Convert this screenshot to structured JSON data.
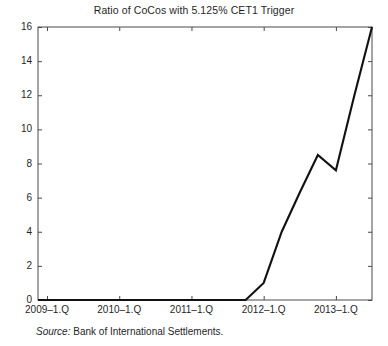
{
  "chart_data": {
    "type": "line",
    "title": "Ratio of CoCos with 5.125% CET1 Trigger",
    "xlabel": "",
    "ylabel": "",
    "grid": false,
    "legend": "none",
    "xlim": [
      2008.875,
      2013.5
    ],
    "ylim": [
      0,
      16
    ],
    "yticks": [
      0,
      2,
      4,
      6,
      8,
      10,
      12,
      14,
      16
    ],
    "ytick_labels": [
      "0",
      "2",
      "4",
      "6",
      "8",
      "10",
      "12",
      "14",
      "16"
    ],
    "xticks": [
      2009.0,
      2010.0,
      2011.0,
      2012.0,
      2013.0
    ],
    "xtick_labels": [
      "2009–1.Q",
      "2010–1.Q",
      "2011–1.Q",
      "2012–1.Q",
      "2013–1.Q"
    ],
    "line_color": "#111111",
    "x": [
      2008.875,
      2009.0,
      2009.25,
      2009.5,
      2009.75,
      2010.0,
      2010.25,
      2010.5,
      2010.75,
      2011.0,
      2011.25,
      2011.5,
      2011.75,
      2012.0,
      2012.25,
      2012.5,
      2012.75,
      2013.0,
      2013.25,
      2013.5
    ],
    "values": [
      0,
      0,
      0,
      0,
      0,
      0,
      0,
      0,
      0,
      0,
      0,
      0,
      0,
      1.0,
      4.0,
      6.3,
      8.5,
      7.6,
      11.9,
      16.0
    ],
    "x_labels": [
      "2008–4.Q",
      "2009–1.Q",
      "2009–2.Q",
      "2009–3.Q",
      "2009–4.Q",
      "2010–1.Q",
      "2010–2.Q",
      "2010–3.Q",
      "2010–4.Q",
      "2011–1.Q",
      "2011–2.Q",
      "2011–3.Q",
      "2011–4.Q",
      "2012–1.Q",
      "2012–2.Q",
      "2012–3.Q",
      "2012–4.Q",
      "2013–1.Q",
      "2013–2.Q",
      "2013–3.Q"
    ]
  },
  "source": {
    "label": "Source:",
    "text": "Bank of International Settlements."
  }
}
